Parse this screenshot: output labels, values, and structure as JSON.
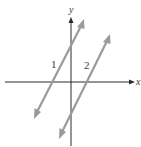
{
  "diagram": {
    "axes": {
      "x_label": "x",
      "y_label": "y"
    },
    "lines": [
      {
        "id": "1",
        "label": "1",
        "color": "#9a9a9a",
        "relation": "crosses y-axis above origin, x-axis left of origin"
      },
      {
        "id": "2",
        "label": "2",
        "color": "#9a9a9a",
        "relation": "crosses y-axis below origin, x-axis right of origin"
      }
    ],
    "axis_color": "#2b2b2b"
  }
}
